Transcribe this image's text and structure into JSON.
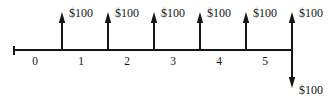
{
  "figure": {
    "kind": "cash-flow-timeline",
    "background_color": "#ffffff",
    "stroke_color": "#161616",
    "text_color": "#161616"
  },
  "axis": {
    "y": 50,
    "x_start": 14,
    "x_end": 292,
    "start_cap_height": 9,
    "period_labels": [
      "0",
      "1",
      "2",
      "3",
      "4",
      "5"
    ],
    "period_label_x": [
      35,
      81,
      127,
      173,
      219,
      265
    ],
    "period_label_y": 56
  },
  "chart_data": {
    "type": "bar",
    "title": "",
    "xlabel": "",
    "ylabel": "",
    "categories": [
      "0",
      "1",
      "2",
      "3",
      "4",
      "5"
    ],
    "series": [
      {
        "name": "Cash inflows",
        "values": [
          100,
          100,
          100,
          100,
          100,
          100
        ],
        "direction": "up"
      },
      {
        "name": "Cash outflow",
        "values": [
          0,
          0,
          0,
          0,
          0,
          -100
        ],
        "direction": "down"
      }
    ],
    "annotations": [
      "$100",
      "$100",
      "$100",
      "$100",
      "$100",
      "$100",
      "$100"
    ]
  },
  "inflows": [
    {
      "id": "inflow-1",
      "x": 62,
      "tip_y": 12,
      "label": "$100",
      "label_x": 69,
      "label_y": 7
    },
    {
      "id": "inflow-2",
      "x": 108,
      "tip_y": 12,
      "label": "$100",
      "label_x": 115,
      "label_y": 7
    },
    {
      "id": "inflow-3",
      "x": 154,
      "tip_y": 12,
      "label": "$100",
      "label_x": 161,
      "label_y": 7
    },
    {
      "id": "inflow-4",
      "x": 200,
      "tip_y": 12,
      "label": "$100",
      "label_x": 207,
      "label_y": 7
    },
    {
      "id": "inflow-5",
      "x": 246,
      "tip_y": 12,
      "label": "$100",
      "label_x": 253,
      "label_y": 7
    },
    {
      "id": "inflow-6",
      "x": 292,
      "tip_y": 12,
      "label": "$100",
      "label_x": 299,
      "label_y": 7
    }
  ],
  "outflows": [
    {
      "id": "outflow-1",
      "x": 292,
      "tip_y": 88,
      "label": "$100",
      "label_x": 299,
      "label_y": 84
    }
  ]
}
